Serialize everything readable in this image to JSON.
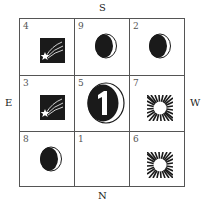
{
  "compass": {
    "top": "S",
    "bottom": "N",
    "left": "E",
    "right": "W"
  },
  "grid": {
    "rows": [
      [
        {
          "number": "4",
          "icon": "shooting-star-icon"
        },
        {
          "number": "9",
          "icon": "crescent-moon-icon"
        },
        {
          "number": "2",
          "icon": "crescent-moon-icon"
        }
      ],
      [
        {
          "number": "3",
          "icon": "shooting-star-icon"
        },
        {
          "number": "5",
          "icon": "tai-chi-one-moon-icon"
        },
        {
          "number": "7",
          "icon": "sun-burst-icon"
        }
      ],
      [
        {
          "number": "8",
          "icon": "crescent-moon-icon"
        },
        {
          "number": "1",
          "icon": ""
        },
        {
          "number": "6",
          "icon": "sun-burst-icon"
        }
      ]
    ]
  },
  "colors": {
    "ink": "#1a1a1a",
    "lines": "#555555",
    "background": "#ffffff"
  }
}
